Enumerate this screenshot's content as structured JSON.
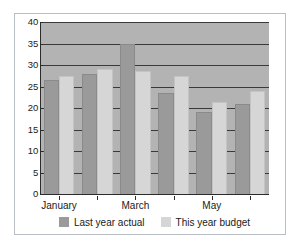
{
  "chart_data": {
    "type": "bar",
    "title": "",
    "subtitle": "",
    "xlabel": "",
    "ylabel": "",
    "ylim": [
      0,
      40
    ],
    "yticks": [
      0,
      5,
      10,
      15,
      20,
      25,
      30,
      35,
      40
    ],
    "grid": true,
    "legend_position": "bottom",
    "categories": [
      "January",
      "",
      "March",
      "",
      "May",
      ""
    ],
    "visible_tick_labels": [
      "January",
      "March",
      "May"
    ],
    "series": [
      {
        "name": "Last year actual",
        "color": "#9a9a9a",
        "values": [
          26.5,
          28,
          35,
          23.5,
          19,
          21
        ]
      },
      {
        "name": "This year budget",
        "color": "#d6d6d6",
        "values": [
          27.5,
          29,
          28.5,
          27.5,
          21.5,
          24
        ]
      }
    ]
  },
  "axis": {
    "y_tick_labels": [
      "40",
      "35",
      "30",
      "25",
      "20",
      "15",
      "10",
      "5",
      "0"
    ],
    "x_tick_labels": [
      "January",
      "March",
      "May"
    ]
  },
  "legend": {
    "items": [
      {
        "label": "Last year actual",
        "swatch": "dark-swatch"
      },
      {
        "label": "This year budget",
        "swatch": "light-swatch"
      }
    ]
  },
  "colors": {
    "plot_background": "#b3b3b3",
    "figure_background": "#ffffff",
    "gridline": "#3a3a3a",
    "axis": "#2b2b2b",
    "series_dark": "#9a9a9a",
    "series_light": "#d6d6d6",
    "frame_border": "#b9bec6",
    "text": "#1a1a1a"
  }
}
